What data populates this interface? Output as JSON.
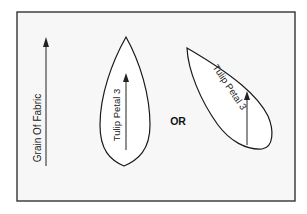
{
  "diagram": {
    "background": "#ffffff",
    "frame_fill": "#f7f7f7",
    "stroke_color": "#1a1a1a",
    "grain_label": "Grain Of Fabric",
    "separator_label": "OR",
    "petals": [
      {
        "label": "Tulip Petal 3",
        "orientation": "vertical"
      },
      {
        "label": "Tulip Petal 3",
        "orientation": "tilted"
      }
    ]
  }
}
